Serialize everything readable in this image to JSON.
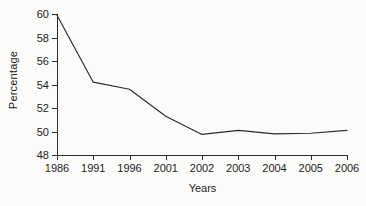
{
  "chart_data": {
    "type": "line",
    "title": "",
    "xlabel": "Years",
    "ylabel": "Percentage",
    "categories": [
      "1986",
      "1991",
      "1996",
      "2001",
      "2002",
      "2003",
      "2004",
      "2005",
      "2006"
    ],
    "values": [
      59.9,
      54.2,
      53.6,
      51.3,
      49.75,
      50.1,
      49.8,
      49.85,
      50.1
    ],
    "series": [
      {
        "name": "Percentage",
        "values": [
          59.9,
          54.2,
          53.6,
          51.3,
          49.75,
          50.1,
          49.8,
          49.85,
          50.1
        ]
      }
    ],
    "ylim": [
      48,
      60
    ],
    "yticks": [
      48,
      50,
      52,
      54,
      56,
      58,
      60
    ],
    "ytick_labels": [
      "48",
      "50",
      "52",
      "54",
      "56",
      "58",
      "60"
    ],
    "grid": false,
    "legend": false,
    "legend_position": "none",
    "line_color": "#2b2b2b",
    "background_color": "#fbfbf9",
    "axis_color": "#2b2b2b"
  }
}
